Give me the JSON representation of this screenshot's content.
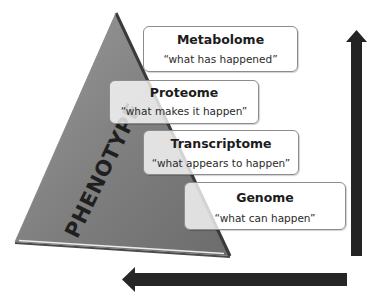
{
  "diagram": {
    "type": "omics-pyramid",
    "pyramid": {
      "label": "PHENOTYPE",
      "fill_color": "#7b7b7b",
      "edge_color": "#3a3a3a",
      "highlight_color": "#e6e6e6"
    },
    "layers": [
      {
        "name": "Metabolome",
        "description": "“what has happened”"
      },
      {
        "name": "Proteome",
        "description": "“what makes it happen”"
      },
      {
        "name": "Transcriptome",
        "description": "“what appears to happen”"
      },
      {
        "name": "Genome",
        "description": "“what can happen”"
      }
    ],
    "arrows": {
      "vertical": {
        "direction": "up",
        "color": "#222222"
      },
      "horizontal": {
        "direction": "left",
        "color": "#222222"
      }
    }
  }
}
